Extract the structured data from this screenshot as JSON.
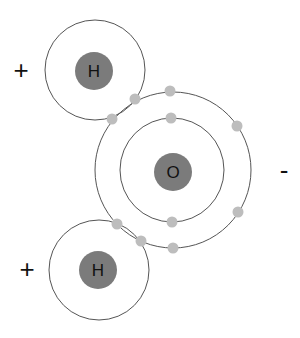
{
  "diagram": {
    "colors": {
      "nucleus": "#7b7b7b",
      "electron": "#bdbdbd",
      "orbit": "#555555",
      "background": "#ffffff"
    },
    "atoms": [
      {
        "id": "hydrogen-top",
        "symbol": "H",
        "charge": "+",
        "center": [
          95,
          70
        ],
        "shell_radius": 50,
        "nucleus_radius": 19
      },
      {
        "id": "oxygen",
        "symbol": "O",
        "charge": "-",
        "center": [
          173,
          171
        ],
        "inner_radius": 54,
        "outer_radius": 78,
        "nucleus_radius": 19
      },
      {
        "id": "hydrogen-bottom",
        "symbol": "H",
        "charge": "+",
        "center": [
          99,
          270
        ],
        "shell_radius": 50,
        "nucleus_radius": 19
      }
    ],
    "electrons": {
      "oxygen_inner": [
        [
          171,
          118
        ],
        [
          172,
          222
        ]
      ],
      "oxygen_outer": [
        [
          170,
          90
        ],
        [
          237,
          126
        ],
        [
          238,
          213
        ],
        [
          173,
          248
        ]
      ],
      "shared_top": [
        [
          134,
          99
        ],
        [
          112,
          119
        ]
      ],
      "shared_bottom": [
        [
          116,
          224
        ],
        [
          141,
          240
        ]
      ]
    },
    "charges": [
      {
        "symbol": "+",
        "position": [
          21,
          70
        ]
      },
      {
        "symbol": "-",
        "position": [
          284,
          170
        ]
      },
      {
        "symbol": "+",
        "position": [
          27,
          269
        ]
      }
    ]
  }
}
